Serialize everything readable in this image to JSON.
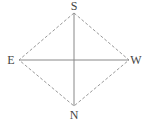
{
  "diagram": {
    "labels": {
      "top": "S",
      "bottom": "N",
      "left": "E",
      "right": "W"
    },
    "colors": {
      "line": "#888888",
      "dashed": "#999999",
      "text": "#444444"
    }
  }
}
